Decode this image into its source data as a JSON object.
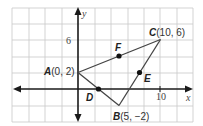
{
  "diagram": {
    "axes": {
      "x_label": "x",
      "y_label": "y",
      "x_tick_label": "10",
      "y_tick_label": "6"
    },
    "points": {
      "A": {
        "name": "A",
        "coords": "(0, 2)",
        "x": 0,
        "y": 2
      },
      "B": {
        "name": "B",
        "coords": "(5, −2)",
        "x": 5,
        "y": -2
      },
      "C": {
        "name": "C",
        "coords": "(10, 6)",
        "x": 10,
        "y": 6
      },
      "D": {
        "name": "D",
        "x": 2.5,
        "y": 0
      },
      "E": {
        "name": "E",
        "x": 7.5,
        "y": 2
      },
      "F": {
        "name": "F",
        "x": 5,
        "y": 4
      }
    },
    "segments": [
      "AB",
      "BC",
      "CA"
    ],
    "grid": {
      "unit_per_square": 2,
      "x_range": [
        -8,
        14
      ],
      "y_range": [
        -4,
        10
      ]
    },
    "colors": {
      "grid": "#c8c8c8",
      "axis": "#1a1a1a",
      "segment": "#444444",
      "point": "#111111"
    }
  }
}
